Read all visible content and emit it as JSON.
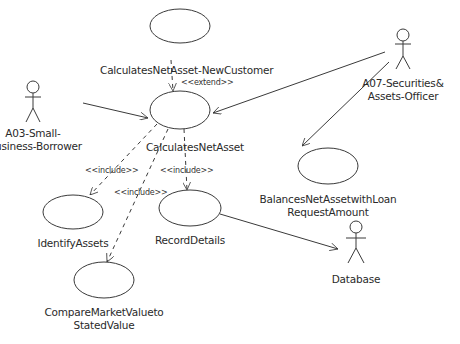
{
  "diagram": {
    "type": "UML use case diagram",
    "actors": [
      {
        "id": "a03",
        "label_line1": "A03-Small-",
        "label_line2": "Business-Borrower"
      },
      {
        "id": "a07",
        "label_line1": "A07-Securities&",
        "label_line2": "Assets-Officer"
      },
      {
        "id": "db",
        "label_line1": "Database"
      }
    ],
    "use_cases": [
      {
        "id": "newcustomer",
        "label": "CalculatesNetAsset-NewCustomer"
      },
      {
        "id": "calc",
        "label": "CalculatesNetAsset"
      },
      {
        "id": "identify",
        "label": "IdentifyAssets"
      },
      {
        "id": "record",
        "label": "RecordDetails"
      },
      {
        "id": "compare",
        "label_line1": "CompareMarketValueto",
        "label_line2": "StatedValue"
      },
      {
        "id": "balances",
        "label_line1": "BalancesNetAssetwithLoan",
        "label_line2": "RequestAmount"
      }
    ],
    "relationships": [
      {
        "from": "newcustomer",
        "to": "calc",
        "stereotype": "<<extend>>"
      },
      {
        "from": "calc",
        "to": "identify",
        "stereotype": "<<include>>"
      },
      {
        "from": "calc",
        "to": "compare",
        "stereotype": "<<include>>"
      },
      {
        "from": "calc",
        "to": "record",
        "stereotype": "<<include>>"
      },
      {
        "from": "a03",
        "to": "calc"
      },
      {
        "from": "a07",
        "to": "calc"
      },
      {
        "from": "a07",
        "to": "balances"
      },
      {
        "from": "record",
        "to": "db"
      }
    ]
  },
  "colors": {
    "line": "#3a3a3a",
    "text": "#2a2a2a",
    "background": "#ffffff"
  }
}
